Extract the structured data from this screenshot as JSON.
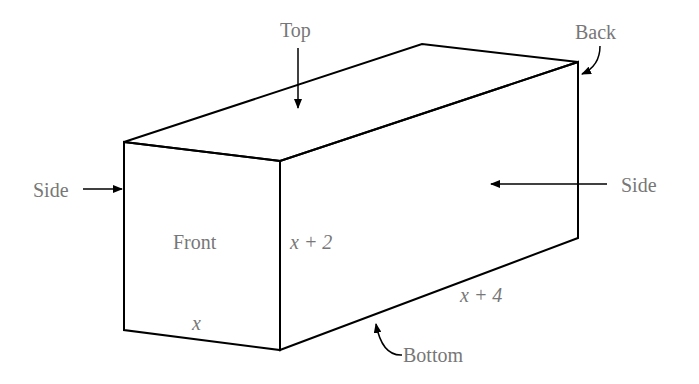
{
  "diagram": {
    "labels": {
      "top": "Top",
      "back": "Back",
      "side_left": "Side",
      "side_right": "Side",
      "front": "Front",
      "bottom": "Bottom"
    },
    "dimensions": {
      "width": "x",
      "height": "x + 2",
      "length": "x + 4"
    },
    "colors": {
      "lines": "#000000",
      "text": "#777777"
    }
  }
}
